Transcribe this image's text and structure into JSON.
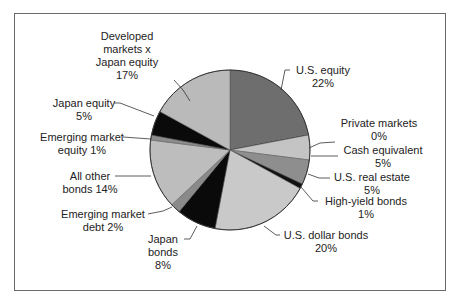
{
  "chart_data": {
    "type": "pie",
    "title": "",
    "start_angle_deg": 0,
    "direction": "clockwise",
    "slices": [
      {
        "label": "U.S. equity",
        "value": 22,
        "color": "#6e6e6e"
      },
      {
        "label": "Private markets",
        "value": 0,
        "color": "#555555"
      },
      {
        "label": "Cash equivalent",
        "value": 5,
        "color": "#c4c4c4"
      },
      {
        "label": "U.S. real estate",
        "value": 5,
        "color": "#8e8e8e"
      },
      {
        "label": "High-yield bonds",
        "value": 1,
        "color": "#111111"
      },
      {
        "label": "U.S. dollar bonds",
        "value": 20,
        "color": "#c9c9c9"
      },
      {
        "label": "Japan bonds",
        "value": 8,
        "color": "#0a0a0a"
      },
      {
        "label": "Emerging market debt",
        "value": 2,
        "color": "#8a8a8a"
      },
      {
        "label": "All other bonds",
        "value": 14,
        "color": "#bdbdbd"
      },
      {
        "label": "Emerging market equity",
        "value": 1,
        "color": "#8c8c8c"
      },
      {
        "label": "Japan equity",
        "value": 5,
        "color": "#0a0a0a"
      },
      {
        "label": "Developed markets x Japan equity",
        "value": 17,
        "color": "#bababa"
      }
    ]
  },
  "labels": {
    "dev_line1": "Developed",
    "dev_line2": "markets x",
    "dev_line3": "Japan equity",
    "dev_pct": "17%",
    "us_equity": "U.S. equity",
    "us_equity_pct": "22%",
    "private_markets": "Private markets",
    "private_markets_pct": "0%",
    "cash_equivalent": "Cash equivalent",
    "cash_equivalent_pct": "5%",
    "us_real_estate": "U.S. real estate",
    "us_real_estate_pct": "5%",
    "high_yield": "High-yield bonds",
    "high_yield_pct": "1%",
    "us_dollar_bonds": "U.S. dollar bonds",
    "us_dollar_bonds_pct": "20%",
    "japan_bonds_line1": "Japan",
    "japan_bonds_line2": "bonds",
    "japan_bonds_pct": "8%",
    "em_debt_line1": "Emerging market",
    "em_debt_line2": "debt 2%",
    "all_other_line1": "All other",
    "all_other_line2": "bonds 14%",
    "em_equity_line1": "Emerging market",
    "em_equity_line2": "equity 1%",
    "japan_equity": "Japan equity",
    "japan_equity_pct": "5%"
  }
}
